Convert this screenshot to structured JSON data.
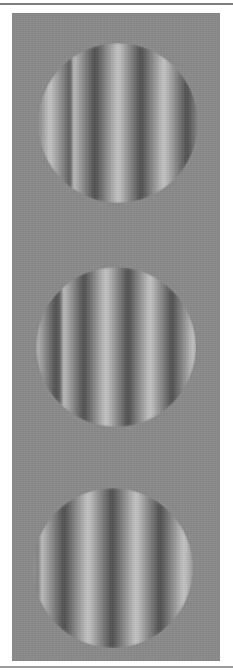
{
  "figure": {
    "background_color": "#8b8b8b",
    "light_color": "#c8c8c8",
    "dark_color": "#4e4e4e",
    "top_clipped_text": "· · ·",
    "gratings": [
      {
        "name": "grating-1",
        "cx": 118,
        "cy": 123,
        "radius": 80,
        "orientation": "vertical",
        "period_px": 46,
        "phase_offset_px": 0
      },
      {
        "name": "grating-2",
        "cx": 116,
        "cy": 347,
        "radius": 80,
        "orientation": "vertical",
        "period_px": 44,
        "phase_offset_px": -10
      },
      {
        "name": "grating-3",
        "cx": 113,
        "cy": 568,
        "radius": 80,
        "orientation": "vertical",
        "period_px": 48,
        "phase_offset_px": -25
      }
    ]
  }
}
